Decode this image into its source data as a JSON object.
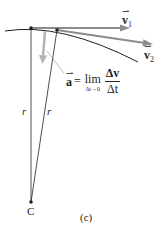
{
  "figure": {
    "caption": "(c)",
    "center_label": "C",
    "radius_labels": [
      "r",
      "r"
    ],
    "vectors": [
      {
        "name": "v1",
        "label": "v",
        "subscript": "1",
        "color": "#8a8a8a"
      },
      {
        "name": "v2",
        "label": "v",
        "subscript": "2",
        "color": "#8a8a8a"
      }
    ],
    "acceleration": {
      "label": "a",
      "equals": "=",
      "lim": "lim",
      "lim_subscript": "Δt→0",
      "numerator": "Δv",
      "denominator": "Δt",
      "color": "#a6a6a6"
    },
    "colors": {
      "ink": "#231f20",
      "arrow_gray": "#8c8c8c",
      "light_gray": "#b3b3b3"
    }
  }
}
